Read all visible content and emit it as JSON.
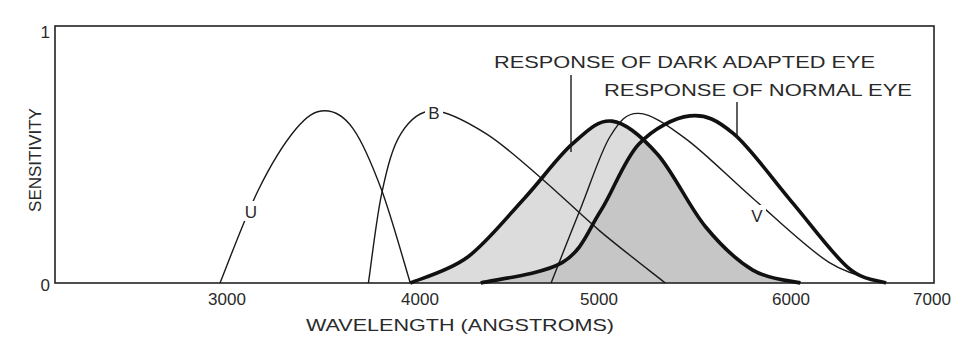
{
  "chart_data": {
    "type": "line",
    "title": "",
    "xlabel": "WAVELENGTH (ANGSTROMS)",
    "ylabel": "SENSITIVITY",
    "xlim": [
      2100,
      7000
    ],
    "ylim": [
      0,
      1
    ],
    "x_ticks": [
      3000,
      4000,
      5000,
      6000,
      7000
    ],
    "x_tick_labels": [
      "3000",
      "4000",
      "5000",
      "6000",
      "7000"
    ],
    "y_ticks": [
      0,
      1
    ],
    "y_tick_labels": [
      "0",
      "1"
    ],
    "grid": false,
    "legend": "none (inline labels)",
    "series": [
      {
        "name": "U",
        "style": "thin",
        "x": [
          3000,
          3200,
          3400,
          3550,
          3700,
          3850,
          4000
        ],
        "y": [
          0.0,
          0.36,
          0.6,
          0.67,
          0.6,
          0.36,
          0.0
        ]
      },
      {
        "name": "B",
        "style": "thin",
        "x": [
          3780,
          3850,
          3950,
          4120,
          4400,
          4700,
          5000,
          5340
        ],
        "y": [
          0.0,
          0.35,
          0.58,
          0.67,
          0.58,
          0.4,
          0.2,
          0.0
        ]
      },
      {
        "name": "V",
        "style": "thin",
        "x": [
          4740,
          4900,
          5050,
          5200,
          5450,
          5800,
          6200,
          6500
        ],
        "y": [
          0.0,
          0.3,
          0.57,
          0.66,
          0.56,
          0.33,
          0.08,
          0.0
        ]
      },
      {
        "name": "RESPONSE OF DARK ADAPTED EYE",
        "style": "thick, filled light gray",
        "x": [
          4000,
          4300,
          4600,
          4850,
          5060,
          5300,
          5550,
          5800,
          6050
        ],
        "y": [
          0.0,
          0.1,
          0.33,
          0.54,
          0.63,
          0.5,
          0.22,
          0.05,
          0.0
        ]
      },
      {
        "name": "RESPONSE OF NORMAL EYE",
        "style": "thick",
        "x": [
          4370,
          4800,
          5000,
          5200,
          5470,
          5700,
          6000,
          6300,
          6500
        ],
        "y": [
          0.0,
          0.08,
          0.28,
          0.54,
          0.65,
          0.58,
          0.32,
          0.06,
          0.0
        ]
      }
    ],
    "annotations": [
      {
        "text": "U",
        "x": 3170,
        "y": 0.29
      },
      {
        "text": "B",
        "x": 4120,
        "y": 0.67
      },
      {
        "text": "V",
        "x": 5800,
        "y": 0.27
      },
      {
        "text": "RESPONSE OF DARK ADAPTED EYE",
        "pointer_to_x": 4840,
        "pointer_to_y": 0.51
      },
      {
        "text": "RESPONSE OF NORMAL EYE",
        "pointer_to_x": 5720,
        "pointer_to_y": 0.57
      }
    ],
    "colors": {
      "line": "#1a1a1a",
      "fill_dark_adapted": "#dcdcdc",
      "fill_overlap": "#c6c6c6",
      "background": "#ffffff"
    }
  },
  "labels": {
    "y_axis": "SENSITIVITY",
    "x_axis": "WAVELENGTH (ANGSTROMS)",
    "y_top": "1",
    "y_bottom": "0",
    "x_ticks": [
      "3000",
      "4000",
      "5000",
      "6000",
      "7000"
    ],
    "curve_u": "U",
    "curve_b": "B",
    "curve_v": "V",
    "dark_adapted": "RESPONSE OF DARK ADAPTED EYE",
    "normal_eye": "RESPONSE OF NORMAL EYE"
  }
}
